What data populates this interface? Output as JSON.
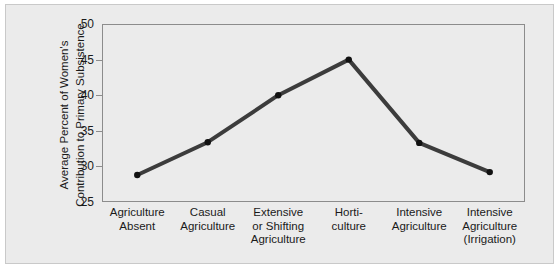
{
  "chart_data": {
    "type": "line",
    "title": "",
    "xlabel": "",
    "ylabel_line1": "Average Percent of Women's",
    "ylabel_line2": "Contribution to Primary Subsistence",
    "categories": [
      "Agriculture\nAbsent",
      "Casual\nAgriculture",
      "Extensive\nor Shifting\nAgriculture",
      "Horti-\nculture",
      "Intensive\nAgriculture",
      "Intensive\nAgriculture\n(Irrigation)"
    ],
    "categories_flat": [
      "Agriculture Absent",
      "Casual Agriculture",
      "Extensive or Shifting Agriculture",
      "Horticulture",
      "Intensive Agriculture",
      "Intensive Agriculture (Irrigation)"
    ],
    "values": [
      28.8,
      33.4,
      40.0,
      45.0,
      33.3,
      29.2
    ],
    "ylim": [
      25,
      50
    ],
    "yticks": [
      50,
      45,
      40,
      35,
      30,
      25
    ],
    "grid": false,
    "legend": false,
    "marker": "circle",
    "line_color": "#3c3c3c",
    "marker_color": "#111111",
    "panel_color": "#ebebeb",
    "axis_color": "#8c8c8c"
  }
}
